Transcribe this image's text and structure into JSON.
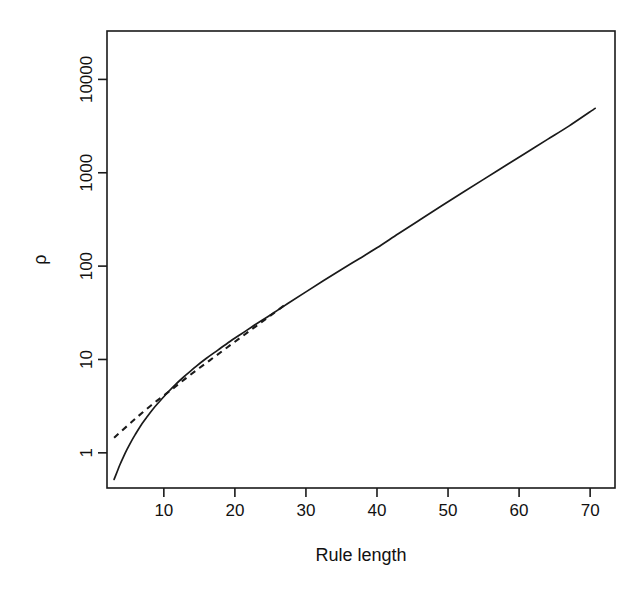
{
  "chart_data": {
    "type": "line",
    "title": "",
    "subtitle": "",
    "xlabel": "Rule length",
    "ylabel": "ρ",
    "xscale": "linear",
    "yscale": "log",
    "xlim": [
      2.0,
      73.5
    ],
    "ylim": [
      0.42,
      33000
    ],
    "grid": false,
    "legend": null,
    "frame": true,
    "xticks": [
      10,
      20,
      30,
      40,
      50,
      60,
      70
    ],
    "xtick_labels": [
      "10",
      "20",
      "30",
      "40",
      "50",
      "60",
      "70"
    ],
    "yticks": [
      1,
      10,
      100,
      1000,
      10000
    ],
    "ytick_labels": [
      "1",
      "10",
      "100",
      "1000",
      "10000"
    ],
    "ytick_label_rotation": 90,
    "annotations": [],
    "series": [
      {
        "name": "rho-curve",
        "style": "solid",
        "x": [
          3.0,
          3.4,
          3.8,
          4.3,
          4.8,
          5.4,
          6.0,
          6.7,
          7.5,
          8.4,
          9.4,
          10.5,
          11.7,
          13.0,
          14.5,
          16.0,
          17.6,
          19.3,
          21.0,
          23.0,
          25.0,
          27.5,
          30.0,
          32.5,
          35.0,
          37.5,
          40.0,
          43.0,
          46.0,
          49.0,
          52.0,
          55.0,
          58.0,
          61.0,
          64.0,
          67.0,
          70.7
        ],
        "y": [
          0.52,
          0.62,
          0.74,
          0.9,
          1.08,
          1.32,
          1.58,
          1.93,
          2.35,
          2.9,
          3.55,
          4.4,
          5.45,
          6.7,
          8.4,
          10.3,
          12.6,
          15.6,
          19.0,
          24.0,
          30.0,
          40.0,
          53.0,
          70.0,
          92.0,
          120.0,
          157.0,
          222.0,
          312.0,
          437.0,
          610.0,
          850.0,
          1180.0,
          1640.0,
          2280.0,
          3160.0,
          4900.0
        ]
      },
      {
        "name": "rho-asymptote",
        "style": "dashed",
        "x": [
          3.0,
          4.0,
          5.5,
          7.0,
          9.0,
          11.0,
          13.0,
          15.0,
          17.0,
          19.0,
          21.0,
          23.0,
          25.0,
          27.0
        ],
        "y": [
          1.45,
          1.7,
          2.15,
          2.7,
          3.6,
          4.7,
          6.2,
          8.1,
          10.5,
          13.6,
          17.6,
          22.8,
          29.5,
          38.2
        ]
      }
    ]
  },
  "geometry": {
    "plot_left": 107,
    "plot_right": 615,
    "plot_top": 31,
    "plot_bottom": 488
  },
  "colors": {
    "line": "#1a1a1a",
    "background": "#ffffff",
    "text": "#111111"
  }
}
